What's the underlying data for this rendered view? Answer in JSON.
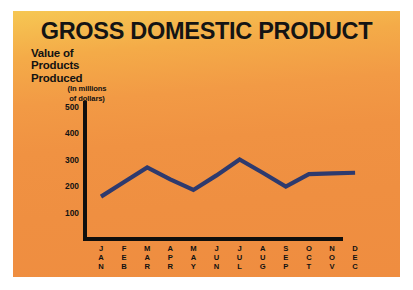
{
  "poster": {
    "background_top_color": "#f6c753",
    "background_bottom_color": "#ef8d40",
    "border_color": "#ffffff"
  },
  "chart_data": {
    "type": "line",
    "title": "GROSS DOMESTIC PRODUCT",
    "ylabel": "Value of Products Produced",
    "ylabel_units": "(In millions of dollars)",
    "ylabel_line1": "Value of",
    "ylabel_line2": "Products",
    "ylabel_line3": "Produced",
    "units_line1": "(In millions",
    "units_line2": "of dollars)",
    "xlabel": "",
    "categories": [
      "JAN",
      "FEB",
      "MAR",
      "APR",
      "MAY",
      "JUN",
      "JUL",
      "AUG",
      "SEP",
      "OCT",
      "NOV",
      "DEC"
    ],
    "values": [
      160,
      215,
      270,
      225,
      185,
      240,
      300,
      250,
      198,
      245,
      248,
      250
    ],
    "yticks": [
      500,
      400,
      300,
      200,
      100
    ],
    "ylim": [
      0,
      500
    ],
    "grid": false,
    "legend": false,
    "line_color": "#2e3a6e",
    "axis_color": "#100f0d",
    "text_color": "#131313"
  }
}
